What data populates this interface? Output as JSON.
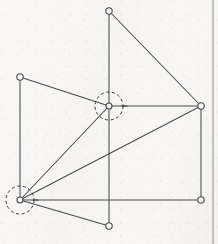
{
  "figure": {
    "canvas": {
      "width": 218,
      "height": 244
    },
    "background_color": "#f7f6f4",
    "line_color": "#4a4a4e",
    "node_fill_color": "#f7f6f4",
    "dashed_circle_color": "#3a3a3e",
    "page_edge": {
      "label": "page-edge-line",
      "x": 213,
      "y1": 0,
      "y2": 244,
      "color": "#9a9a9a"
    },
    "nodes": [
      {
        "id": "A",
        "label": "top-apex-node",
        "x": 109,
        "y": 11,
        "radius": 3.2,
        "highlighted": false
      },
      {
        "id": "B",
        "label": "upper-left-node",
        "x": 20,
        "y": 77,
        "radius": 3.2,
        "highlighted": false
      },
      {
        "id": "C",
        "label": "center-hub-node",
        "x": 109,
        "y": 106,
        "radius": 3.0,
        "highlighted": true,
        "highlight_radius": 14
      },
      {
        "id": "D",
        "label": "right-node",
        "x": 201,
        "y": 106,
        "radius": 3.2,
        "highlighted": false
      },
      {
        "id": "E",
        "label": "lower-left-hub-node",
        "x": 20,
        "y": 200,
        "radius": 3.0,
        "highlighted": true,
        "highlight_radius": 14
      },
      {
        "id": "F",
        "label": "bottom-right-node",
        "x": 201,
        "y": 200,
        "radius": 3.2,
        "highlighted": false
      },
      {
        "id": "G",
        "label": "bottom-center-node",
        "x": 109,
        "y": 226,
        "radius": 3.2,
        "highlighted": false
      }
    ],
    "edges": [
      {
        "from": "A",
        "to": "D",
        "label": "edge-top-to-right"
      },
      {
        "from": "A",
        "to": "C",
        "label": "edge-top-to-center-vertical"
      },
      {
        "from": "B",
        "to": "C",
        "label": "edge-upperleft-to-center"
      },
      {
        "from": "B",
        "to": "E",
        "label": "edge-upperleft-to-lowerleft-vertical"
      },
      {
        "from": "C",
        "to": "D",
        "label": "edge-center-to-right-horizontal"
      },
      {
        "from": "C",
        "to": "E",
        "label": "edge-center-to-lowerleft"
      },
      {
        "from": "C",
        "to": "G",
        "label": "edge-center-to-bottomcenter-vertical"
      },
      {
        "from": "E",
        "to": "D",
        "label": "edge-lowerleft-to-right"
      },
      {
        "from": "E",
        "to": "F",
        "label": "edge-lowerleft-to-bottomright-horizontal"
      },
      {
        "from": "E",
        "to": "G",
        "label": "edge-lowerleft-to-bottomcenter"
      },
      {
        "from": "D",
        "to": "F",
        "label": "edge-right-to-bottomright-vertical"
      }
    ],
    "tick_marks": [
      {
        "label": "tick-center-right",
        "x1": 122,
        "y1": 106,
        "x2": 127,
        "y2": 106
      },
      {
        "label": "tick-lowerleft-right",
        "x1": 33,
        "y1": 200,
        "x2": 38,
        "y2": 200
      }
    ]
  }
}
